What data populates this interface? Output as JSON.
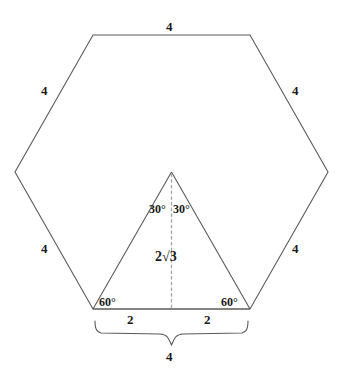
{
  "figure": {
    "stroke_color": "#5a5a5a",
    "dash_color": "#9a9a9a",
    "text_color": "#1a1a1a",
    "background_color": "#ffffff"
  },
  "hexagon": {
    "side_labels": {
      "top": "4",
      "upper_left": "4",
      "upper_right": "4",
      "lower_left": "4",
      "lower_right": "4"
    }
  },
  "triangle": {
    "apex_angle_left": "30°",
    "apex_angle_right": "30°",
    "base_angle_left": "60°",
    "base_angle_right": "60°",
    "height_label_prefix": "2",
    "height_label_radical": "√3",
    "height_label": "2√3",
    "base_segment_left": "2",
    "base_segment_right": "2"
  },
  "brace": {
    "label": "4"
  }
}
